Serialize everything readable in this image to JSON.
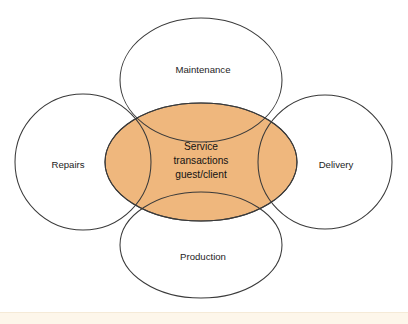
{
  "diagram": {
    "type": "venn-petal",
    "title_visible": false,
    "background_color": "#ffffff",
    "outline_color": "#3a3a3a",
    "core": {
      "fill_color": "#efb77d",
      "shape": "ellipse",
      "label_lines": [
        "Service",
        "transactions",
        "guest/client"
      ],
      "center": {
        "x": 201,
        "y": 162
      },
      "radius": {
        "x": 96,
        "y": 59
      }
    },
    "lobes": [
      {
        "key": "maintenance",
        "label": "Maintenance",
        "position": "top",
        "shape": "ellipse",
        "fill_color": "#ffffff",
        "center": {
          "x": 201,
          "y": 80
        },
        "radius": {
          "x": 81,
          "y": 62
        },
        "label_point": {
          "x": 203,
          "y": 70
        }
      },
      {
        "key": "repairs",
        "label": "Repairs",
        "position": "left",
        "shape": "circle",
        "fill_color": "#ffffff",
        "center": {
          "x": 83,
          "y": 162
        },
        "radius": {
          "x": 68,
          "y": 68
        },
        "label_point": {
          "x": 68,
          "y": 165
        }
      },
      {
        "key": "delivery",
        "label": "Delivery",
        "position": "right",
        "shape": "circle",
        "fill_color": "#ffffff",
        "center": {
          "x": 325,
          "y": 162
        },
        "radius": {
          "x": 67,
          "y": 67
        },
        "label_point": {
          "x": 336,
          "y": 165
        }
      },
      {
        "key": "production",
        "label": "Production",
        "position": "bottom",
        "shape": "ellipse",
        "fill_color": "#ffffff",
        "center": {
          "x": 201,
          "y": 245
        },
        "radius": {
          "x": 81,
          "y": 53
        },
        "label_point": {
          "x": 203,
          "y": 257
        }
      }
    ],
    "footer_band": {
      "color": "#fdf6ea",
      "border_color": "#f5ead7"
    }
  }
}
